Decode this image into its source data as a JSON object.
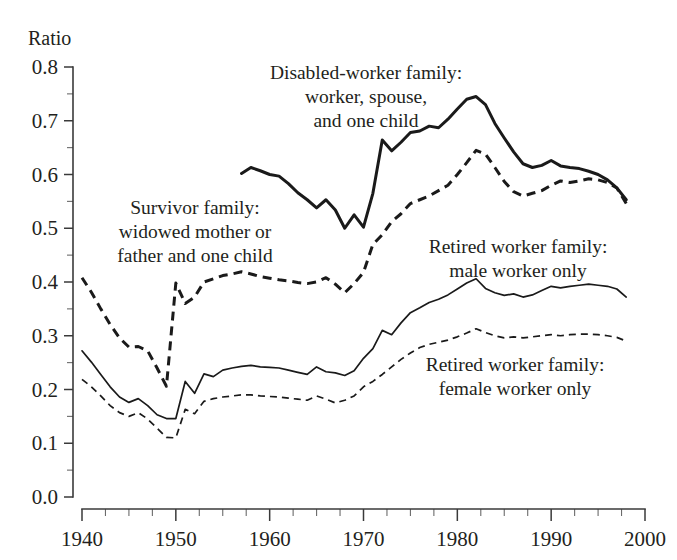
{
  "chart_data": {
    "type": "line",
    "title": "",
    "xlabel": "",
    "ylabel": "Ratio",
    "xlim": [
      1940,
      2000
    ],
    "ylim": [
      0.0,
      0.8
    ],
    "grid": false,
    "legend_position": "inline-annotations",
    "x_ticks": [
      "1940",
      "1950",
      "1960",
      "1970",
      "1980",
      "1990",
      "2000"
    ],
    "x_tick_values": [
      1940,
      1950,
      1960,
      1970,
      1980,
      1990,
      2000
    ],
    "x_minor_interval": 2.5,
    "y_ticks": [
      "0.0",
      "0.1",
      "0.2",
      "0.3",
      "0.4",
      "0.5",
      "0.6",
      "0.7",
      "0.8"
    ],
    "y_tick_values": [
      0.0,
      0.1,
      0.2,
      0.3,
      0.4,
      0.5,
      0.6,
      0.7,
      0.8
    ],
    "y_minor_interval": 0.05,
    "annotations": [
      {
        "name": "disabled-worker-label",
        "lines": [
          "Disabled-worker family:",
          "worker, spouse,",
          "and one child"
        ],
        "x": 366,
        "y": 79,
        "anchor": "middle"
      },
      {
        "name": "survivor-label",
        "lines": [
          "Survivor family:",
          "widowed mother or",
          "father and one child"
        ],
        "x": 195,
        "y": 214,
        "anchor": "middle"
      },
      {
        "name": "retired-male-label",
        "lines": [
          "Retired worker family:",
          "male worker only"
        ],
        "x": 518,
        "y": 253,
        "anchor": "middle"
      },
      {
        "name": "retired-female-label",
        "lines": [
          "Retired worker family:",
          "female worker only"
        ],
        "x": 515,
        "y": 371,
        "anchor": "middle"
      }
    ],
    "series": [
      {
        "name": "disabled-worker-family",
        "label": "Disabled-worker family: worker, spouse, and one child",
        "style": "solid",
        "weight": "thick",
        "color": "#1a1a1a",
        "x": [
          1957,
          1958,
          1959,
          1960,
          1961,
          1962,
          1963,
          1964,
          1965,
          1966,
          1967,
          1968,
          1969,
          1970,
          1971,
          1972,
          1973,
          1974,
          1975,
          1976,
          1977,
          1978,
          1979,
          1980,
          1981,
          1982,
          1983,
          1984,
          1985,
          1986,
          1987,
          1988,
          1989,
          1990,
          1991,
          1992,
          1993,
          1994,
          1995,
          1996,
          1997,
          1998
        ],
        "y": [
          0.602,
          0.613,
          0.607,
          0.6,
          0.597,
          0.583,
          0.566,
          0.553,
          0.538,
          0.553,
          0.534,
          0.5,
          0.525,
          0.502,
          0.565,
          0.664,
          0.644,
          0.66,
          0.678,
          0.681,
          0.69,
          0.687,
          0.703,
          0.722,
          0.74,
          0.745,
          0.73,
          0.695,
          0.668,
          0.642,
          0.62,
          0.613,
          0.617,
          0.626,
          0.616,
          0.613,
          0.611,
          0.606,
          0.6,
          0.59,
          0.575,
          0.553
        ]
      },
      {
        "name": "survivor-family",
        "label": "Survivor family: widowed mother or father and one child",
        "style": "dashed",
        "weight": "thick",
        "color": "#1a1a1a",
        "x": [
          1940,
          1941,
          1942,
          1943,
          1944,
          1945,
          1946,
          1947,
          1948,
          1949,
          1950,
          1951,
          1952,
          1953,
          1954,
          1955,
          1956,
          1957,
          1958,
          1959,
          1960,
          1961,
          1962,
          1963,
          1964,
          1965,
          1966,
          1967,
          1968,
          1969,
          1970,
          1971,
          1972,
          1973,
          1974,
          1975,
          1976,
          1977,
          1978,
          1979,
          1980,
          1981,
          1982,
          1983,
          1984,
          1985,
          1986,
          1987,
          1988,
          1989,
          1990,
          1991,
          1992,
          1993,
          1994,
          1995,
          1996,
          1997,
          1998
        ],
        "y": [
          0.408,
          0.381,
          0.35,
          0.321,
          0.296,
          0.279,
          0.28,
          0.272,
          0.24,
          0.206,
          0.398,
          0.36,
          0.372,
          0.4,
          0.406,
          0.412,
          0.415,
          0.419,
          0.415,
          0.41,
          0.407,
          0.404,
          0.402,
          0.399,
          0.397,
          0.4,
          0.408,
          0.396,
          0.38,
          0.397,
          0.418,
          0.47,
          0.488,
          0.512,
          0.527,
          0.546,
          0.553,
          0.56,
          0.57,
          0.58,
          0.6,
          0.622,
          0.645,
          0.638,
          0.613,
          0.587,
          0.568,
          0.56,
          0.565,
          0.57,
          0.58,
          0.588,
          0.585,
          0.588,
          0.592,
          0.59,
          0.585,
          0.575,
          0.546
        ]
      },
      {
        "name": "retired-worker-family-male",
        "label": "Retired worker family: male worker only",
        "style": "solid",
        "weight": "thin",
        "color": "#1a1a1a",
        "x": [
          1940,
          1941,
          1942,
          1943,
          1944,
          1945,
          1946,
          1947,
          1948,
          1949,
          1950,
          1951,
          1952,
          1953,
          1954,
          1955,
          1956,
          1957,
          1958,
          1959,
          1960,
          1961,
          1962,
          1963,
          1964,
          1965,
          1966,
          1967,
          1968,
          1969,
          1970,
          1971,
          1972,
          1973,
          1974,
          1975,
          1976,
          1977,
          1978,
          1979,
          1980,
          1981,
          1982,
          1983,
          1984,
          1985,
          1986,
          1987,
          1988,
          1989,
          1990,
          1991,
          1992,
          1993,
          1994,
          1995,
          1996,
          1997,
          1998
        ],
        "y": [
          0.272,
          0.251,
          0.228,
          0.205,
          0.186,
          0.176,
          0.183,
          0.17,
          0.153,
          0.146,
          0.146,
          0.215,
          0.193,
          0.229,
          0.224,
          0.236,
          0.24,
          0.243,
          0.245,
          0.242,
          0.241,
          0.24,
          0.236,
          0.232,
          0.228,
          0.242,
          0.233,
          0.231,
          0.226,
          0.235,
          0.258,
          0.276,
          0.31,
          0.302,
          0.324,
          0.343,
          0.352,
          0.362,
          0.368,
          0.376,
          0.387,
          0.398,
          0.406,
          0.388,
          0.38,
          0.375,
          0.378,
          0.372,
          0.376,
          0.384,
          0.392,
          0.389,
          0.392,
          0.394,
          0.396,
          0.394,
          0.392,
          0.387,
          0.372
        ]
      },
      {
        "name": "retired-worker-family-female",
        "label": "Retired worker family: female worker only",
        "style": "dashed",
        "weight": "thin",
        "color": "#1a1a1a",
        "x": [
          1940,
          1941,
          1942,
          1943,
          1944,
          1945,
          1946,
          1947,
          1948,
          1949,
          1950,
          1951,
          1952,
          1953,
          1954,
          1955,
          1956,
          1957,
          1958,
          1959,
          1960,
          1961,
          1962,
          1963,
          1964,
          1965,
          1966,
          1967,
          1968,
          1969,
          1970,
          1971,
          1972,
          1973,
          1974,
          1975,
          1976,
          1977,
          1978,
          1979,
          1980,
          1981,
          1982,
          1983,
          1984,
          1985,
          1986,
          1987,
          1988,
          1989,
          1990,
          1991,
          1992,
          1993,
          1994,
          1995,
          1996,
          1997,
          1998
        ],
        "y": [
          0.219,
          0.205,
          0.188,
          0.17,
          0.157,
          0.15,
          0.157,
          0.145,
          0.128,
          0.111,
          0.11,
          0.163,
          0.155,
          0.178,
          0.183,
          0.186,
          0.188,
          0.19,
          0.19,
          0.188,
          0.187,
          0.186,
          0.184,
          0.182,
          0.18,
          0.188,
          0.182,
          0.175,
          0.18,
          0.188,
          0.205,
          0.215,
          0.228,
          0.242,
          0.256,
          0.268,
          0.278,
          0.284,
          0.288,
          0.292,
          0.298,
          0.305,
          0.313,
          0.306,
          0.3,
          0.296,
          0.298,
          0.296,
          0.298,
          0.3,
          0.302,
          0.3,
          0.302,
          0.303,
          0.303,
          0.302,
          0.3,
          0.297,
          0.29
        ]
      }
    ]
  },
  "axes": {
    "y_axis_title": "Ratio"
  }
}
